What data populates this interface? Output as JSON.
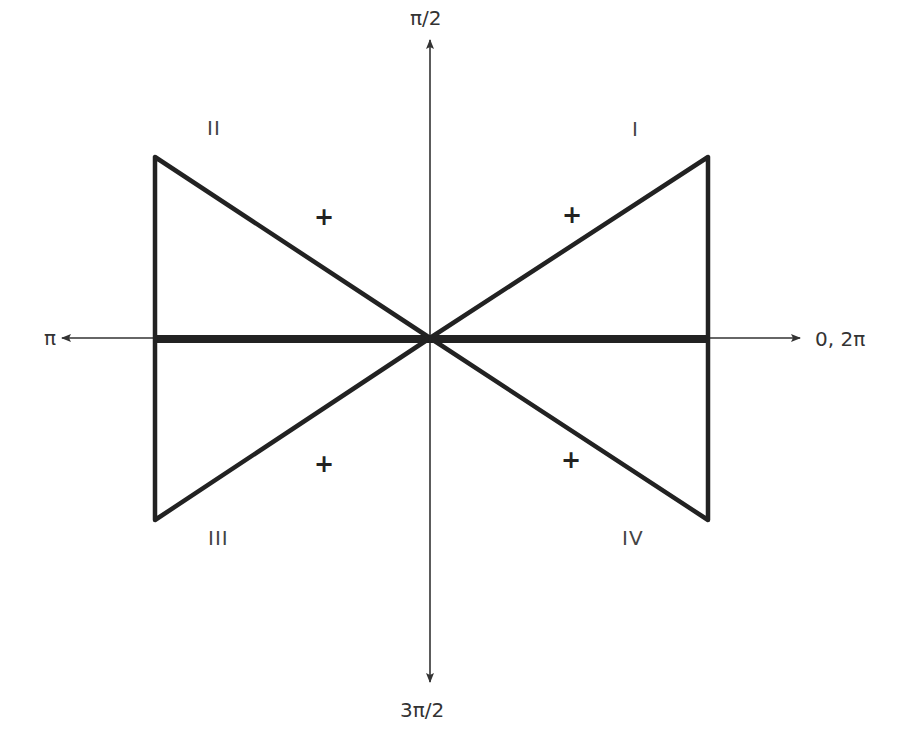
{
  "diagram": {
    "type": "unit-circle-sign-diagram",
    "axis_labels": {
      "top": "π/2",
      "left": "π",
      "right": "0, 2π",
      "bottom": "3π/2"
    },
    "quadrants": [
      {
        "name": "I",
        "sign": "+"
      },
      {
        "name": "II",
        "sign": "+"
      },
      {
        "name": "III",
        "sign": "+"
      },
      {
        "name": "IV",
        "sign": "+"
      }
    ],
    "colors": {
      "line": "#222222",
      "axis": "#333333",
      "text": "#333333",
      "background": "#ffffff"
    }
  }
}
